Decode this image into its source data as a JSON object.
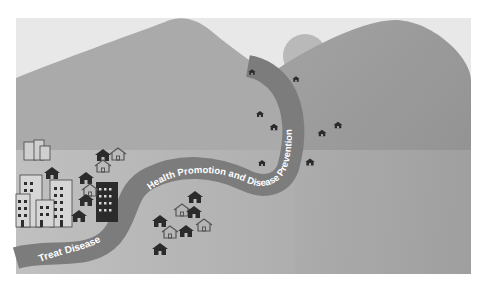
{
  "illustration": {
    "river_labels": {
      "start": "Treat Disease",
      "end": "Health Promotion and Disease Prevention"
    },
    "colors": {
      "background": "#ffffff",
      "frame": "#e6e6e6",
      "mountain_left": "#a9a9a9",
      "mountain_right": "#9a9a9a",
      "sun": "#b8b8b8",
      "plain": "#bdbdbd",
      "river": "#7d7d7d",
      "river_text": "#ffffff",
      "building_dark": "#2b2b2b",
      "building_outline": "#555555"
    },
    "elements": {
      "mountains": 2,
      "sun": 1,
      "city_buildings": 4,
      "houses_left_cluster": 8,
      "houses_center_cluster": 8,
      "houses_mountain": 9
    }
  }
}
